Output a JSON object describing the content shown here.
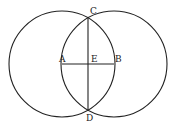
{
  "diagram": {
    "type": "geometric-construction",
    "stroke_color": "#222222",
    "background": "#ffffff",
    "points": {
      "A": {
        "label": "A",
        "x": 62,
        "y": 64
      },
      "B": {
        "label": "B",
        "x": 114,
        "y": 64
      },
      "C": {
        "label": "C",
        "x": 88,
        "y": 18
      },
      "D": {
        "label": "D",
        "x": 88,
        "y": 110
      },
      "E": {
        "label": "E",
        "x": 88,
        "y": 64
      }
    },
    "circles": [
      {
        "name": "circle-centered-A",
        "center": "A",
        "cx": 62,
        "cy": 64,
        "r": 53
      },
      {
        "name": "circle-centered-B",
        "center": "B",
        "cx": 114,
        "cy": 64,
        "r": 53
      }
    ],
    "segments": [
      {
        "name": "segment-AB",
        "from": "A",
        "to": "B"
      },
      {
        "name": "segment-CD",
        "from": "C",
        "to": "D"
      }
    ],
    "labels": {
      "A": "A",
      "B": "B",
      "C": "C",
      "D": "D",
      "E": "E"
    }
  }
}
